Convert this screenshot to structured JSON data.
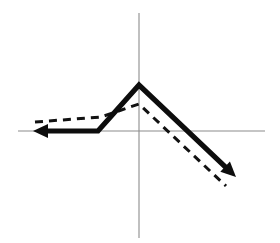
{
  "figure": {
    "title": "",
    "background_color": "#ffffff",
    "width": 280,
    "height": 243
  },
  "chart_data": {
    "type": "line",
    "title": "",
    "xlabel": "",
    "ylabel": "",
    "grid": false,
    "legend": "none",
    "axes": {
      "origin": [
        139,
        131
      ],
      "x_axis": {
        "x1": 18,
        "y1": 131,
        "x2": 265,
        "y2": 131,
        "color": "#8c8c8c"
      },
      "y_axis": {
        "x1": 139,
        "y1": 13,
        "x2": 139,
        "y2": 238,
        "color": "#8c8c8c"
      }
    },
    "series": [
      {
        "name": "solid-curve",
        "style": "solid",
        "color": "#0d0d0d",
        "stroke_width": 5.2,
        "arrow_start": true,
        "arrow_end": true,
        "points": [
          [
            33,
            131
          ],
          [
            98,
            131
          ],
          [
            139,
            85
          ],
          [
            236,
            177
          ]
        ]
      },
      {
        "name": "dashed-curve",
        "style": "dashed",
        "color": "#121212",
        "stroke_width": 3.0,
        "arrow_start": false,
        "arrow_end": false,
        "points": [
          [
            35,
            122
          ],
          [
            101,
            117
          ],
          [
            139,
            104
          ],
          [
            226,
            186
          ]
        ]
      }
    ],
    "annotations": []
  },
  "labels": {
    "solid_series_name": "solid-curve",
    "dashed_series_name": "dashed-curve",
    "x_axis_name": "x-axis",
    "y_axis_name": "y-axis"
  }
}
